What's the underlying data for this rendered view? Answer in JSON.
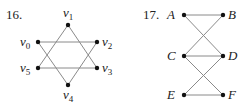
{
  "figures": [
    {
      "number": "16.",
      "vertices": [
        {
          "id": "v0",
          "name": "v",
          "sub": "0",
          "x": 38,
          "y": 42,
          "lx": 20,
          "ly": 46,
          "anchor": "start"
        },
        {
          "id": "v1",
          "name": "v",
          "sub": "1",
          "x": 68,
          "y": 25,
          "lx": 63,
          "ly": 17,
          "anchor": "start"
        },
        {
          "id": "v2",
          "name": "v",
          "sub": "2",
          "x": 97,
          "y": 42,
          "lx": 102,
          "ly": 46,
          "anchor": "start"
        },
        {
          "id": "v3",
          "name": "v",
          "sub": "3",
          "x": 97,
          "y": 68,
          "lx": 102,
          "ly": 72,
          "anchor": "start"
        },
        {
          "id": "v4",
          "name": "v",
          "sub": "4",
          "x": 68,
          "y": 85,
          "lx": 63,
          "ly": 99,
          "anchor": "start"
        },
        {
          "id": "v5",
          "name": "v",
          "sub": "5",
          "x": 38,
          "y": 68,
          "lx": 20,
          "ly": 72,
          "anchor": "start"
        }
      ],
      "edges": [
        [
          "v0",
          "v2"
        ],
        [
          "v5",
          "v3"
        ],
        [
          "v1",
          "v5"
        ],
        [
          "v1",
          "v3"
        ],
        [
          "v0",
          "v4"
        ],
        [
          "v2",
          "v4"
        ]
      ]
    },
    {
      "number": "17.",
      "vertices": [
        {
          "id": "A",
          "name": "A",
          "x": 184,
          "y": 15,
          "lx": 167,
          "ly": 19
        },
        {
          "id": "B",
          "name": "B",
          "x": 223,
          "y": 15,
          "lx": 228,
          "ly": 19
        },
        {
          "id": "C",
          "name": "C",
          "x": 184,
          "y": 56,
          "lx": 167,
          "ly": 60
        },
        {
          "id": "D",
          "name": "D",
          "x": 223,
          "y": 56,
          "lx": 228,
          "ly": 60
        },
        {
          "id": "E",
          "name": "E",
          "x": 184,
          "y": 95,
          "lx": 167,
          "ly": 99
        },
        {
          "id": "F",
          "name": "F",
          "x": 223,
          "y": 95,
          "lx": 228,
          "ly": 99
        }
      ],
      "edges": [
        [
          "A",
          "B"
        ],
        [
          "A",
          "D"
        ],
        [
          "B",
          "C"
        ],
        [
          "C",
          "D"
        ],
        [
          "C",
          "F"
        ],
        [
          "D",
          "E"
        ],
        [
          "E",
          "F"
        ]
      ]
    }
  ]
}
